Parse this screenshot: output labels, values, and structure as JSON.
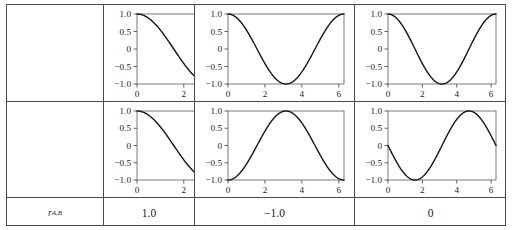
{
  "figure": {
    "type": "grid-of-plots",
    "rows": 2,
    "cols": 3,
    "corner_label": "r",
    "corner_label_sub": "A,B"
  },
  "axes": {
    "xticks": [
      "0",
      "2",
      "4",
      "6"
    ],
    "xtick_values": [
      0,
      2,
      4,
      6
    ],
    "yticks": [
      "1.0",
      "0.5",
      "0",
      "-0.5",
      "-1.0"
    ],
    "ytick_values": [
      1.0,
      0.5,
      0,
      -0.5,
      -1.0
    ],
    "xlim": [
      0,
      6.283185
    ],
    "ylim": [
      -1.0,
      1.0
    ],
    "xlabel": "",
    "ylabel": "",
    "grid": false
  },
  "chart_data": {
    "type": "line",
    "title": "",
    "xlabel": "",
    "ylabel": "",
    "xlim": [
      0,
      6.283185
    ],
    "ylim": [
      -1.0,
      1.0
    ],
    "grid": false,
    "legend": "none",
    "xticks": [
      0,
      2,
      4,
      6
    ],
    "yticks": [
      -1.0,
      -0.5,
      0,
      0.5,
      1.0
    ],
    "panels": [
      {
        "row": 0,
        "col": 0,
        "series_name": "A",
        "function": "cos(x)",
        "amplitude": 1.0,
        "phase_deg": 0,
        "x": [
          0.0,
          0.393,
          0.785,
          1.178,
          1.571,
          1.963,
          2.356,
          2.749,
          3.142,
          3.534,
          3.927,
          4.32,
          4.712,
          5.105,
          5.498,
          5.89,
          6.283
        ],
        "y": [
          1.0,
          0.924,
          0.707,
          0.383,
          0.0,
          -0.383,
          -0.707,
          -0.924,
          -1.0,
          -0.924,
          -0.707,
          -0.383,
          0.0,
          0.383,
          0.707,
          0.924,
          1.0
        ]
      },
      {
        "row": 0,
        "col": 1,
        "series_name": "A",
        "function": "cos(x)",
        "amplitude": 1.0,
        "phase_deg": 0,
        "x": [
          0.0,
          0.393,
          0.785,
          1.178,
          1.571,
          1.963,
          2.356,
          2.749,
          3.142,
          3.534,
          3.927,
          4.32,
          4.712,
          5.105,
          5.498,
          5.89,
          6.283
        ],
        "y": [
          1.0,
          0.924,
          0.707,
          0.383,
          0.0,
          -0.383,
          -0.707,
          -0.924,
          -1.0,
          -0.924,
          -0.707,
          -0.383,
          0.0,
          0.383,
          0.707,
          0.924,
          1.0
        ]
      },
      {
        "row": 0,
        "col": 2,
        "series_name": "A",
        "function": "cos(x)",
        "amplitude": 1.0,
        "phase_deg": 0,
        "x": [
          0.0,
          0.393,
          0.785,
          1.178,
          1.571,
          1.963,
          2.356,
          2.749,
          3.142,
          3.534,
          3.927,
          4.32,
          4.712,
          5.105,
          5.498,
          5.89,
          6.283
        ],
        "y": [
          1.0,
          0.924,
          0.707,
          0.383,
          0.0,
          -0.383,
          -0.707,
          -0.924,
          -1.0,
          -0.924,
          -0.707,
          -0.383,
          0.0,
          0.383,
          0.707,
          0.924,
          1.0
        ]
      },
      {
        "row": 1,
        "col": 0,
        "series_name": "B",
        "function": "cos(x)",
        "amplitude": 1.0,
        "phase_deg": 0,
        "x": [
          0.0,
          0.393,
          0.785,
          1.178,
          1.571,
          1.963,
          2.356,
          2.749,
          3.142,
          3.534,
          3.927,
          4.32,
          4.712,
          5.105,
          5.498,
          5.89,
          6.283
        ],
        "y": [
          1.0,
          0.924,
          0.707,
          0.383,
          0.0,
          -0.383,
          -0.707,
          -0.924,
          -1.0,
          -0.924,
          -0.707,
          -0.383,
          0.0,
          0.383,
          0.707,
          0.924,
          1.0
        ]
      },
      {
        "row": 1,
        "col": 1,
        "series_name": "B",
        "function": "-cos(x)",
        "amplitude": 1.0,
        "phase_deg": 180,
        "x": [
          0.0,
          0.393,
          0.785,
          1.178,
          1.571,
          1.963,
          2.356,
          2.749,
          3.142,
          3.534,
          3.927,
          4.32,
          4.712,
          5.105,
          5.498,
          5.89,
          6.283
        ],
        "y": [
          -1.0,
          -0.924,
          -0.707,
          -0.383,
          0.0,
          0.383,
          0.707,
          0.924,
          1.0,
          0.924,
          0.707,
          0.383,
          0.0,
          -0.383,
          -0.707,
          -0.924,
          -1.0
        ]
      },
      {
        "row": 1,
        "col": 2,
        "series_name": "B",
        "function": "-sin(x)",
        "amplitude": 1.0,
        "phase_deg": 90,
        "x": [
          0.0,
          0.393,
          0.785,
          1.178,
          1.571,
          1.963,
          2.356,
          2.749,
          3.142,
          3.534,
          3.927,
          4.32,
          4.712,
          5.105,
          5.498,
          5.89,
          6.283
        ],
        "y": [
          0.0,
          -0.383,
          -0.707,
          -0.924,
          -1.0,
          -0.924,
          -0.707,
          -0.383,
          0.0,
          0.383,
          0.707,
          0.924,
          1.0,
          0.924,
          0.707,
          0.383,
          0.0
        ]
      }
    ],
    "footer_row": {
      "label": "r_A,B",
      "values": [
        "1.0",
        "-1.0",
        "0"
      ]
    }
  },
  "footer": {
    "label_main": "r",
    "label_sub": "A,B",
    "values": [
      "1.0",
      "−1.0",
      "0"
    ]
  },
  "colors": {
    "curve": "#1a1a1a",
    "frame": "#6b6b6b",
    "table_border": "#4a4a4a",
    "text": "#1c1c1c",
    "background": "#ffffff"
  }
}
